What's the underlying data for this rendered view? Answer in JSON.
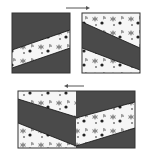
{
  "colors": {
    "background": "#ffffff",
    "dark": "#4a4a4a",
    "light": "#f6f6f6",
    "border": "#333333",
    "speckle": "#8a8a8a",
    "speckle_dark": "#222222",
    "arrow": "#555555"
  },
  "diagram": {
    "arrows": [
      {
        "id": "top-arrow",
        "direction": "right"
      },
      {
        "id": "bottom-arrow",
        "direction": "left"
      }
    ],
    "tiles": [
      {
        "id": "left-tile",
        "layout": "dark-light-dark diagonal bands"
      },
      {
        "id": "right-tile",
        "layout": "light-dark-light diagonal bands"
      },
      {
        "id": "combined-tile",
        "layout": "chevron composition of both tiles"
      }
    ]
  }
}
